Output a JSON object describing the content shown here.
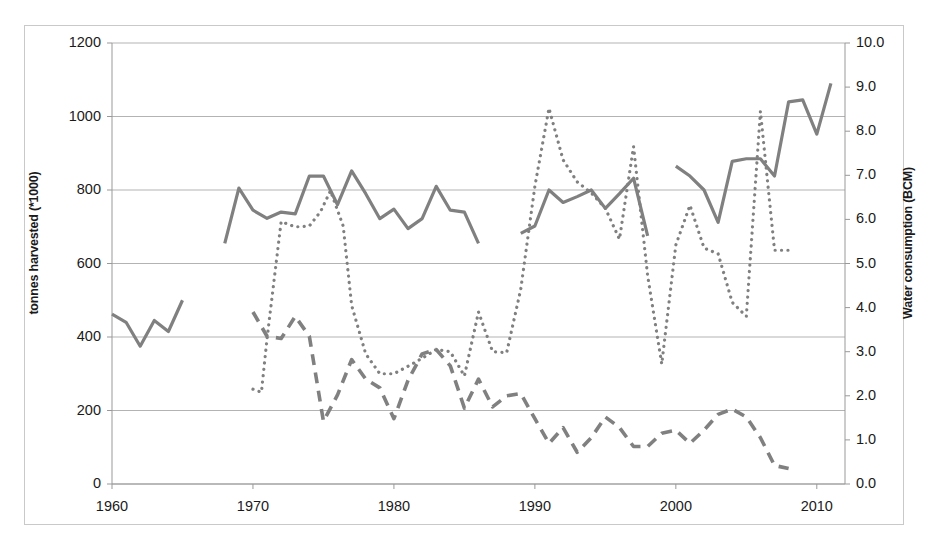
{
  "figure": {
    "background": "#ffffff",
    "frame_color": "#c9c9c9",
    "series_color": "#808080",
    "gridline_color": "#b3b3b3",
    "axis_color": "#999999"
  },
  "axes": {
    "left": {
      "label": "tonnes harvested (*1000)",
      "ticks": [
        "0",
        "200",
        "400",
        "600",
        "800",
        "1000",
        "1200"
      ],
      "min": 0,
      "max": 1200
    },
    "right": {
      "label": "Water consumption (BCM)",
      "ticks": [
        "0.0",
        "1.0",
        "2.0",
        "3.0",
        "4.0",
        "5.0",
        "6.0",
        "7.0",
        "8.0",
        "9.0",
        "10.0"
      ],
      "min": 0,
      "max": 10
    },
    "bottom": {
      "label": "",
      "ticks": [
        "1960",
        "1970",
        "1980",
        "1990",
        "2000",
        "2010"
      ],
      "min": 1960,
      "max": 2012
    }
  },
  "chart_data": {
    "type": "line",
    "title": "",
    "xlabel": "",
    "ylabel": "tonnes harvested (*1000)",
    "y2label": "Water consumption (BCM)",
    "xlim": [
      1960,
      2012
    ],
    "ylim": [
      0,
      1200
    ],
    "y2lim": [
      0,
      10
    ],
    "grid": "horizontal",
    "legend": "none",
    "series": [
      {
        "name": "tonnes-harvested-solid",
        "style": "solid",
        "axis": "left",
        "color": "#808080",
        "width": 3.2,
        "segments": [
          {
            "x": [
              1960,
              1961,
              1962,
              1963,
              1964,
              1965
            ],
            "y": [
              462,
              440,
              375,
              445,
              415,
              500
            ]
          },
          {
            "x": [
              1968,
              1969,
              1970,
              1971,
              1972,
              1973,
              1974,
              1975,
              1976,
              1977,
              1978,
              1979,
              1980,
              1981,
              1982,
              1983,
              1984,
              1985,
              1986
            ],
            "y": [
              655,
              805,
              745,
              723,
              740,
              735,
              838,
              838,
              760,
              852,
              790,
              722,
              748,
              695,
              722,
              810,
              745,
              740,
              655
            ]
          },
          {
            "x": [
              1989,
              1990,
              1991,
              1992,
              1993,
              1994,
              1995,
              1996,
              1997,
              1998
            ],
            "y": [
              682,
              702,
              800,
              766,
              782,
              800,
              750,
              790,
              832,
              675
            ]
          },
          {
            "x": [
              2000,
              2001,
              2002,
              2003,
              2004,
              2005,
              2006,
              2007,
              2008,
              2009,
              2010,
              2011
            ],
            "y": [
              865,
              838,
              800,
              712,
              878,
              885,
              885,
              838,
              1040,
              1045,
              952,
              1090
            ]
          }
        ]
      },
      {
        "name": "water-consumption-dotted",
        "style": "dotted",
        "axis": "right",
        "color": "#808080",
        "width": 3.2,
        "segments": [
          {
            "x": [
              1970,
              1970.6,
              1971,
              1972,
              1973,
              1974,
              1974.8,
              1975.5,
              1976.4,
              1977,
              1978,
              1979,
              1980,
              1981,
              1982,
              1983,
              1984,
              1985,
              1986,
              1987,
              1988,
              1989,
              1990,
              1991,
              1992,
              1993,
              1994,
              1995,
              1996,
              1997,
              1998,
              1999,
              2000,
              2001,
              2002,
              2003,
              2004,
              2005,
              2006,
              2007,
              2008
            ],
            "y": [
              2.15,
              2.08,
              3.3,
              5.95,
              5.83,
              5.85,
              6.18,
              6.65,
              5.85,
              4.05,
              2.95,
              2.5,
              2.5,
              2.67,
              2.85,
              3.05,
              3.0,
              2.45,
              3.9,
              3.0,
              2.98,
              4.42,
              6.75,
              8.52,
              7.35,
              6.85,
              6.6,
              6.25,
              5.55,
              7.65,
              4.72,
              2.72,
              5.42,
              6.32,
              5.35,
              5.22,
              4.12,
              3.8,
              8.45,
              5.3,
              5.3
            ]
          }
        ]
      },
      {
        "name": "water-consumption-dashed",
        "style": "dashed",
        "axis": "right",
        "color": "#808080",
        "width": 3.6,
        "segments": [
          {
            "x": [
              1970,
              1971,
              1972,
              1973,
              1974,
              1975,
              1976,
              1977,
              1978,
              1979,
              1980,
              1981,
              1982,
              1983,
              1984,
              1985,
              1986,
              1987,
              1988,
              1989,
              1990,
              1991,
              1992,
              1993,
              1994,
              1995,
              1996,
              1997,
              1998,
              1999,
              2000,
              2001,
              2002,
              2003,
              2004,
              2005,
              2006,
              2007,
              2008
            ],
            "y": [
              3.9,
              3.35,
              3.3,
              3.8,
              3.35,
              1.42,
              2.02,
              2.82,
              2.38,
              2.18,
              1.48,
              2.35,
              2.95,
              3.05,
              2.68,
              1.72,
              2.38,
              1.75,
              2.0,
              2.05,
              1.48,
              0.92,
              1.28,
              0.72,
              1.05,
              1.52,
              1.28,
              0.85,
              0.85,
              1.15,
              1.22,
              0.92,
              1.22,
              1.58,
              1.7,
              1.52,
              1.05,
              0.42,
              0.35
            ]
          }
        ]
      }
    ]
  }
}
